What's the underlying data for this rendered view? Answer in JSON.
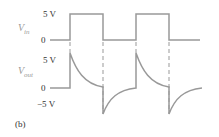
{
  "panel_label": "(b)",
  "vin": {
    "name": "V",
    "subscript": "in",
    "high_label": "5 V",
    "low_label": "0"
  },
  "vout": {
    "name": "V",
    "subscript": "out",
    "high_label": "5 V",
    "zero_label": "0",
    "low_label": "−5 V"
  },
  "colors": {
    "trace": "#999999",
    "text": "#333333",
    "label": "#999999"
  }
}
